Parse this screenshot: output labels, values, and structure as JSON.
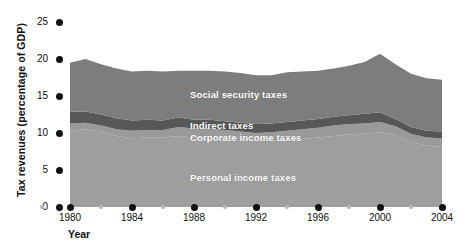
{
  "chart_data": {
    "type": "area",
    "title": "",
    "subtitle": "",
    "xlabel": "Year",
    "ylabel": "Tax revenues (percentage of GDP)",
    "xlim": [
      1980,
      2004
    ],
    "ylim": [
      0,
      25
    ],
    "yticks": [
      0,
      5,
      10,
      15,
      20,
      25
    ],
    "xticks": [
      1980,
      1984,
      1988,
      1992,
      1996,
      2000,
      2004
    ],
    "xticks_minor": [
      1982,
      1986,
      1990,
      1994,
      1998,
      2002
    ],
    "grid": false,
    "legend_position": "inside-plot",
    "stacked": true,
    "x": [
      1980,
      1981,
      1982,
      1983,
      1984,
      1985,
      1986,
      1987,
      1988,
      1989,
      1990,
      1991,
      1992,
      1993,
      1994,
      1995,
      1996,
      1997,
      1998,
      1999,
      2000,
      2001,
      2002,
      2003,
      2004
    ],
    "series": [
      {
        "name": "Personal income taxes",
        "color": "#9e9e9e",
        "values": [
          10.3,
          10.5,
          10.2,
          9.6,
          9.3,
          9.4,
          9.4,
          9.6,
          9.4,
          9.5,
          9.4,
          9.2,
          9.0,
          9.0,
          9.1,
          9.2,
          9.4,
          9.6,
          9.8,
          9.9,
          10.1,
          9.7,
          8.8,
          8.3,
          8.1
        ]
      },
      {
        "name": "Corporate income taxes",
        "color": "#9a9a9a",
        "values": [
          1.0,
          0.9,
          0.8,
          0.9,
          1.0,
          1.0,
          1.0,
          1.2,
          1.2,
          1.1,
          1.0,
          1.0,
          1.0,
          1.1,
          1.2,
          1.3,
          1.3,
          1.4,
          1.4,
          1.4,
          1.4,
          1.2,
          1.1,
          1.1,
          1.2
        ]
      },
      {
        "name": "Indirect taxes",
        "color": "#575757",
        "values": [
          1.6,
          1.5,
          1.5,
          1.5,
          1.4,
          1.4,
          1.3,
          1.3,
          1.2,
          1.2,
          1.2,
          1.2,
          1.2,
          1.2,
          1.2,
          1.2,
          1.2,
          1.2,
          1.2,
          1.3,
          1.3,
          1.0,
          0.9,
          0.9,
          0.9
        ]
      },
      {
        "name": "Social security taxes",
        "color": "#7d7d7d",
        "values": [
          6.6,
          7.1,
          6.8,
          6.7,
          6.6,
          6.6,
          6.6,
          6.3,
          6.6,
          6.6,
          6.7,
          6.7,
          6.6,
          6.5,
          6.7,
          6.6,
          6.5,
          6.5,
          6.7,
          7.0,
          7.9,
          7.4,
          7.2,
          7.1,
          7.0
        ]
      }
    ],
    "totals": [
      19.5,
      20.0,
      19.3,
      18.7,
      18.3,
      18.4,
      18.3,
      18.4,
      18.4,
      18.4,
      18.3,
      18.1,
      17.8,
      17.8,
      18.2,
      18.3,
      18.4,
      18.7,
      19.1,
      19.6,
      20.7,
      19.3,
      18.0,
      17.4,
      17.2
    ]
  },
  "annotations": {
    "social_security": "Social security taxes",
    "indirect": "Indirect taxes",
    "corporate": "Corporate income taxes",
    "personal": "Personal income taxes"
  },
  "colors": {
    "social_security": "#7d7d7d",
    "indirect": "#575757",
    "corporate": "#9a9a9a",
    "personal": "#9e9e9e",
    "axis_dot_major": "#111111",
    "axis_dot_minor": "#b9b9b9",
    "background": "#ffffff",
    "text": "#111111",
    "label_text": "#ffffff"
  }
}
